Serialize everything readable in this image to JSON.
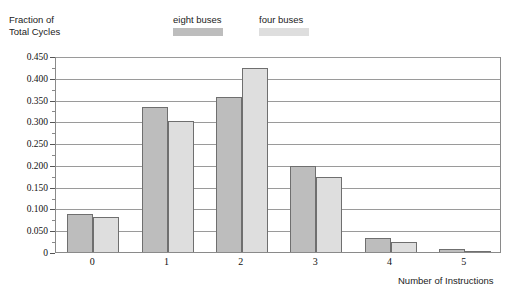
{
  "chart_data": {
    "type": "bar",
    "title": "",
    "ylabel": "Fraction of\nTotal Cycles",
    "xlabel": "Number of Instructions",
    "categories": [
      "0",
      "1",
      "2",
      "3",
      "4",
      "5"
    ],
    "series": [
      {
        "name": "eight buses",
        "color": "#bdbdbd",
        "values": [
          0.088,
          0.333,
          0.357,
          0.197,
          0.032,
          0.007
        ]
      },
      {
        "name": "four buses",
        "color": "#dedede",
        "values": [
          0.08,
          0.3,
          0.422,
          0.173,
          0.023,
          0.001
        ]
      }
    ],
    "ylim": [
      0,
      0.45
    ],
    "yticks": [
      "0",
      "0.050",
      "0.100",
      "0.150",
      "0.200",
      "0.250",
      "0.300",
      "0.350",
      "0.400",
      "0.450"
    ],
    "ytick_values": [
      0,
      0.05,
      0.1,
      0.15,
      0.2,
      0.25,
      0.3,
      0.35,
      0.4,
      0.45
    ],
    "grid": true,
    "grid_axis": "y",
    "legend_position": "top-center",
    "bar_border_color": "#6f6f6f",
    "axis_color": "#8a8a8a"
  }
}
